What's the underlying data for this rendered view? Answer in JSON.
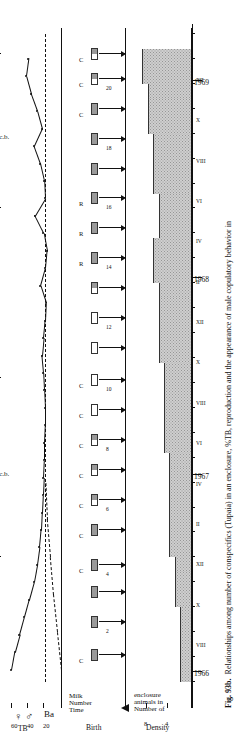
{
  "figure": {
    "number": "Fig. 93b.",
    "caption": "Relationships among number of conspecifics (Tupaia) in an enclosure, %TB, reproduction and the appearance of male copulatory behavior in",
    "symbols": "♀  ♂",
    "symbol_female": "♀",
    "symbol_male": "♂",
    "group_label": "Ba"
  },
  "panels": {
    "tb": {
      "axis_label": "TB",
      "unit_label": "%",
      "ticks": [
        "20",
        "40",
        "60"
      ],
      "tick_values": [
        20,
        40,
        60
      ],
      "reference_line_value": 20,
      "annotation_label": "m.c.b."
    },
    "birth": {
      "axis_label": "Birth",
      "row_labels": [
        "Time",
        "Number",
        "Milk"
      ],
      "litter_label_c": "C",
      "litter_label_r": "R"
    },
    "density": {
      "axis_label": "Density",
      "side_label": "Number of animals in enclosure",
      "ticks": [
        "4",
        "8"
      ],
      "tick_values": [
        4,
        8
      ]
    }
  },
  "time_axis": {
    "years": [
      "1966",
      "1967",
      "1968",
      "1969"
    ],
    "roman_ticks": [
      "VIII",
      "X",
      "XII",
      "II",
      "IV",
      "VI",
      "VIII",
      "X",
      "XII",
      "II",
      "IV",
      "VI",
      "VIII",
      "X",
      "XII"
    ]
  },
  "chart_data": {
    "type": "line",
    "title": "Relationships among number of conspecifics (Tupaia) in an enclosure, %TB, reproduction and the appearance of male copulatory behavior in",
    "xlabel": "",
    "ylabel": "% TB",
    "grid": false,
    "legend": "none",
    "xlim": [
      1966.5,
      1969.1
    ],
    "x_tick_labels": [
      "1966",
      "VIII",
      "X",
      "XII",
      "1967",
      "II",
      "IV",
      "VI",
      "VIII",
      "X",
      "XII",
      "1968",
      "II",
      "IV",
      "VI",
      "VIII",
      "X",
      "XII",
      "1969"
    ],
    "series": [
      {
        "name": "% TB (tail bristling)",
        "ylim": [
          0,
          70
        ],
        "yticks": [
          20,
          40,
          60
        ],
        "reference_dashed_level": 20,
        "x": [
          0.5,
          1.2,
          1.9,
          2.6,
          3.3,
          4.0,
          4.7,
          5.4,
          6.1,
          6.8,
          7.5,
          8.2,
          8.9,
          9.6,
          10.3,
          11.0,
          11.7,
          12.4,
          13.1,
          13.8,
          14.5,
          15.2,
          15.9,
          16.6,
          17.3,
          18.0,
          18.7,
          19.4,
          20.1,
          20.8,
          21.5,
          22.2,
          22.9,
          23.6,
          24.3,
          25.0
        ],
        "values": [
          62,
          58,
          52,
          46,
          40,
          34,
          30,
          27,
          25,
          24,
          23,
          22,
          21,
          21,
          20,
          20,
          21,
          22,
          24,
          22,
          20,
          19,
          26,
          20,
          18,
          22,
          33,
          20,
          21,
          26,
          34,
          24,
          30,
          38,
          44,
          41
        ]
      },
      {
        "name": "% TB (second cohort, dashed onset)",
        "style": "dashed",
        "x": [
          0.5,
          2.0,
          3.5,
          5.0,
          6.5,
          8.0
        ],
        "values": [
          0,
          5,
          10,
          14,
          18,
          20
        ]
      },
      {
        "name": "Density (number of animals in enclosure)",
        "style": "step-area",
        "ylim": [
          0,
          10
        ],
        "yticks": [
          4,
          8
        ],
        "x": [
          0,
          1.5,
          3.0,
          4.4,
          5.0,
          8.6,
          9.2,
          12.2,
          12.8,
          15.4,
          16.0,
          17.2,
          17.8,
          19.0,
          19.6,
          21.4,
          22.0,
          23.4,
          24.0,
          25.4
        ],
        "values": [
          2,
          2,
          3,
          3,
          4,
          4,
          5,
          5,
          6,
          6,
          7,
          7,
          6,
          6,
          7,
          7,
          8,
          8,
          9,
          9
        ]
      }
    ],
    "events": {
      "name": "Births",
      "numbered_ticks": [
        2,
        4,
        6,
        8,
        10,
        12,
        14,
        16,
        18,
        20
      ],
      "items": [
        {
          "index": 1,
          "x": 1.1,
          "number": "",
          "fill": "gray",
          "label": "C"
        },
        {
          "index": 2,
          "x": 2.4,
          "number": "2",
          "fill": "gray",
          "label": ""
        },
        {
          "index": 3,
          "x": 3.6,
          "number": "",
          "fill": "gray",
          "label": ""
        },
        {
          "index": 4,
          "x": 4.7,
          "number": "4",
          "fill": "gray",
          "label": "C"
        },
        {
          "index": 5,
          "x": 6.1,
          "number": "",
          "fill": "gray",
          "label": "C"
        },
        {
          "index": 6,
          "x": 7.3,
          "number": "6",
          "fill": "half",
          "label": "C"
        },
        {
          "index": 7,
          "x": 8.5,
          "number": "",
          "fill": "half",
          "label": "C"
        },
        {
          "index": 8,
          "x": 9.7,
          "number": "8",
          "fill": "half",
          "label": "C"
        },
        {
          "index": 9,
          "x": 10.9,
          "number": "",
          "fill": "white",
          "label": "C"
        },
        {
          "index": 10,
          "x": 12.1,
          "number": "10",
          "fill": "white",
          "label": "C"
        },
        {
          "index": 11,
          "x": 13.4,
          "number": "",
          "fill": "white",
          "label": ""
        },
        {
          "index": 12,
          "x": 14.6,
          "number": "12",
          "fill": "white",
          "label": ""
        },
        {
          "index": 13,
          "x": 15.8,
          "number": "",
          "fill": "half",
          "label": ""
        },
        {
          "index": 14,
          "x": 17.0,
          "number": "14",
          "fill": "gray",
          "label": "R"
        },
        {
          "index": 15,
          "x": 18.2,
          "number": "",
          "fill": "gray",
          "label": "R"
        },
        {
          "index": 16,
          "x": 19.4,
          "number": "16",
          "fill": "gray",
          "label": "R"
        },
        {
          "index": 17,
          "x": 20.6,
          "number": "",
          "fill": "gray",
          "label": ""
        },
        {
          "index": 18,
          "x": 21.8,
          "number": "18",
          "fill": "gray",
          "label": ""
        },
        {
          "index": 19,
          "x": 23.0,
          "number": "",
          "fill": "gray",
          "label": "C"
        },
        {
          "index": 20,
          "x": 24.2,
          "number": "20",
          "fill": "half",
          "label": "C"
        },
        {
          "index": 21,
          "x": 25.2,
          "number": "",
          "fill": "half",
          "label": "C"
        }
      ]
    },
    "annotations": [
      {
        "label": "m.c.b.",
        "from_x": 5.0,
        "to_x": 12.2
      },
      {
        "label": "m.c.b.",
        "from_x": 19.0,
        "to_x": 25.2
      }
    ]
  },
  "colors": {
    "ink": "#111111",
    "fill_gray": "#9a9a9a",
    "area_gray": "#cfcfcf",
    "paper": "#ffffff"
  }
}
